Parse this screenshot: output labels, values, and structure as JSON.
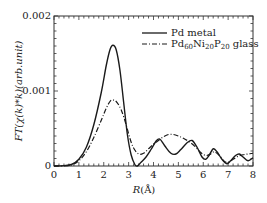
{
  "chart_data": {
    "type": "line",
    "title": "",
    "xlabel": "R(Å)",
    "ylabel": "FT(χ(k)*k)(arb.unit)",
    "xlim": [
      0,
      8
    ],
    "ylim": [
      0,
      0.002
    ],
    "x_ticks": [
      0,
      1,
      2,
      3,
      4,
      5,
      6,
      7,
      8
    ],
    "y_ticks": [
      0,
      0.001,
      0.002
    ],
    "y_tick_labels": [
      "0",
      "0.001",
      "0.002"
    ],
    "grid": false,
    "legend_position": "upper right",
    "series": [
      {
        "name": "Pd metal",
        "style": "solid",
        "points": [
          [
            0,
            0
          ],
          [
            0.4,
            5e-06
          ],
          [
            0.7,
            2e-05
          ],
          [
            1.0,
            9e-05
          ],
          [
            1.3,
            0.00025
          ],
          [
            1.6,
            0.00055
          ],
          [
            1.9,
            0.00098
          ],
          [
            2.1,
            0.00134
          ],
          [
            2.25,
            0.00155
          ],
          [
            2.37,
            0.00161
          ],
          [
            2.5,
            0.00155
          ],
          [
            2.65,
            0.00128
          ],
          [
            2.8,
            0.00085
          ],
          [
            2.95,
            0.00042
          ],
          [
            3.1,
            0.00015
          ],
          [
            3.25,
            2e-05
          ],
          [
            3.35,
            0.0
          ],
          [
            3.5,
            5e-05
          ],
          [
            3.7,
            0.00012
          ],
          [
            3.9,
            0.00022
          ],
          [
            4.1,
            0.00033
          ],
          [
            4.25,
            0.00036
          ],
          [
            4.45,
            0.00027
          ],
          [
            4.7,
            0.00017
          ],
          [
            4.9,
            0.00016
          ],
          [
            5.1,
            0.00022
          ],
          [
            5.35,
            0.00031
          ],
          [
            5.55,
            0.00034
          ],
          [
            5.75,
            0.00025
          ],
          [
            5.95,
            0.00012
          ],
          [
            6.1,
            9e-05
          ],
          [
            6.25,
            0.00015
          ],
          [
            6.4,
            0.00023
          ],
          [
            6.55,
            0.00019
          ],
          [
            6.75,
            9e-05
          ],
          [
            6.95,
            3e-05
          ],
          [
            7.1,
            7e-05
          ],
          [
            7.3,
            0.00014
          ],
          [
            7.45,
            0.00016
          ],
          [
            7.6,
            0.00012
          ],
          [
            7.8,
            7e-05
          ],
          [
            8.0,
            0.00011
          ]
        ]
      },
      {
        "name": "Pd60Ni20P20 glass",
        "name_parts": {
          "base": "Pd",
          "s1": "60",
          "b2": "Ni",
          "s2": "20",
          "b3": "P",
          "s3": "20",
          "tail": " glass"
        },
        "style": "dashdot",
        "points": [
          [
            0,
            0
          ],
          [
            0.4,
            3e-06
          ],
          [
            0.7,
            1.5e-05
          ],
          [
            1.0,
            7e-05
          ],
          [
            1.3,
            0.00019
          ],
          [
            1.6,
            0.00038
          ],
          [
            1.9,
            0.00061
          ],
          [
            2.1,
            0.00077
          ],
          [
            2.25,
            0.00086
          ],
          [
            2.35,
            0.00088
          ],
          [
            2.5,
            0.00086
          ],
          [
            2.7,
            0.00075
          ],
          [
            2.9,
            0.00055
          ],
          [
            3.05,
            0.00037
          ],
          [
            3.2,
            0.00024
          ],
          [
            3.4,
            0.00016
          ],
          [
            3.6,
            0.00017
          ],
          [
            3.8,
            0.00023
          ],
          [
            4.0,
            0.00029
          ],
          [
            4.2,
            0.00034
          ],
          [
            4.4,
            0.00039
          ],
          [
            4.6,
            0.00042
          ],
          [
            4.8,
            0.00042
          ],
          [
            5.0,
            0.0004
          ],
          [
            5.2,
            0.00037
          ],
          [
            5.45,
            0.00032
          ],
          [
            5.7,
            0.00025
          ],
          [
            5.9,
            0.00018
          ],
          [
            6.1,
            0.00014
          ],
          [
            6.3,
            0.00016
          ],
          [
            6.45,
            0.00019
          ],
          [
            6.65,
            0.00014
          ],
          [
            6.85,
            6e-05
          ],
          [
            7.0,
            5e-05
          ],
          [
            7.2,
            9e-05
          ],
          [
            7.4,
            0.00013
          ],
          [
            7.6,
            0.00015
          ],
          [
            7.8,
            0.00016
          ],
          [
            8.0,
            0.00017
          ]
        ]
      }
    ],
    "peaks": {
      "Pd metal": {
        "R": 2.37,
        "value": 0.00161
      },
      "Pd60Ni20P20 glass": {
        "R": 2.35,
        "value": 0.00088
      }
    }
  },
  "legend": {
    "items": [
      {
        "label": "Pd metal",
        "style": "solid"
      },
      {
        "label_base": "Pd",
        "sub1": "60",
        "mid1": "Ni",
        "sub2": "20",
        "mid2": "P",
        "sub3": "20",
        "tail": " glass",
        "style": "dashdot"
      }
    ]
  },
  "axes": {
    "x_label_main": "R",
    "x_label_unit": "(Å)",
    "y_label": "FT(χ(k)*k)(arb.unit)"
  },
  "colors": {
    "line": "#1a1a1a",
    "axis": "#333333",
    "background": "#ffffff"
  }
}
